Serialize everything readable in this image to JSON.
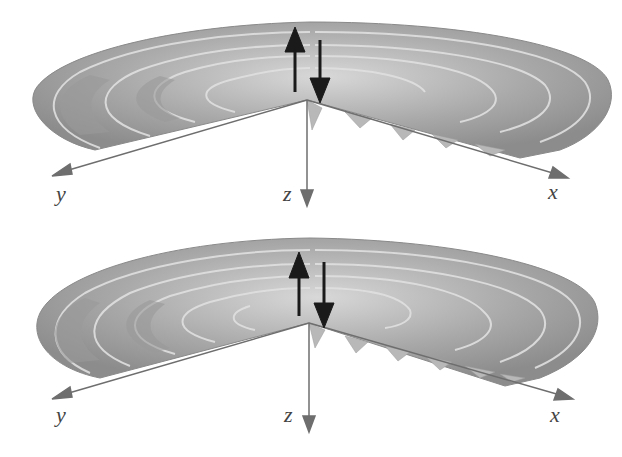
{
  "figure": {
    "panels": [
      {
        "id": "top",
        "axes": {
          "y": "y",
          "z": "z",
          "x": "x"
        },
        "arrows": [
          "up-arrow",
          "down-arrow"
        ]
      },
      {
        "id": "bottom",
        "axes": {
          "y": "y",
          "z": "z",
          "x": "x"
        },
        "arrows": [
          "up-arrow",
          "down-arrow"
        ]
      }
    ]
  },
  "colors": {
    "surface_dark": "#8a8a8a",
    "surface_mid": "#a6a6a6",
    "surface_light": "#cfcfcf",
    "axis": "#6e6e6e",
    "arrow": "#1a1a1a",
    "label": "#444444"
  }
}
